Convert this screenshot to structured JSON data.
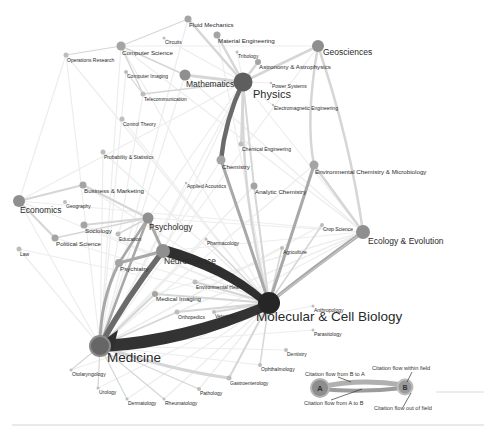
{
  "colors": {
    "background": "#ffffff",
    "faint_edge": "#ececec",
    "light_edge": "#d8d8d8",
    "mid_edge": "#b4b4b4",
    "dark_edge": "#7a7a7a",
    "strongest_edge": "#2e2e2e",
    "node_small": "#b9b9b9",
    "node_mid": "#8f8f8f",
    "node_large": "#5f5f5f",
    "node_hub": "#262626"
  },
  "nodes": [
    {
      "id": "fluid-mechanics",
      "label": "Fluid Mechanics",
      "x": 188,
      "y": 19,
      "r": 3.5,
      "size": "s"
    },
    {
      "id": "material-engineering",
      "label": "Material Engineering",
      "x": 217,
      "y": 35,
      "r": 3.5,
      "size": "s"
    },
    {
      "id": "circuits",
      "label": "Circuits",
      "x": 164,
      "y": 38,
      "r": 1.5,
      "size": "xs"
    },
    {
      "id": "computer-science",
      "label": "Computer Science",
      "x": 121,
      "y": 46,
      "r": 4.5,
      "size": "s"
    },
    {
      "id": "operations-research",
      "label": "Operations Research",
      "x": 66,
      "y": 55,
      "r": 2.5,
      "size": "xs"
    },
    {
      "id": "tribology",
      "label": "Tribology",
      "x": 237,
      "y": 52,
      "r": 1.5,
      "size": "xs"
    },
    {
      "id": "astronomy",
      "label": "Astronomy & Astrophysics",
      "x": 258,
      "y": 62,
      "r": 3,
      "size": "s"
    },
    {
      "id": "geosciences",
      "label": "Geosciences",
      "x": 318,
      "y": 46,
      "r": 6,
      "size": "m"
    },
    {
      "id": "computer-imaging",
      "label": "Computer Imaging",
      "x": 126,
      "y": 72,
      "r": 2,
      "size": "xs"
    },
    {
      "id": "mathematics",
      "label": "Mathematics",
      "x": 185,
      "y": 75,
      "r": 5.5,
      "size": "m"
    },
    {
      "id": "physics",
      "label": "Physics",
      "x": 243,
      "y": 82,
      "r": 9.5,
      "size": "l"
    },
    {
      "id": "power-systems",
      "label": "Power Systems",
      "x": 271,
      "y": 83,
      "r": 1.2,
      "size": "xs"
    },
    {
      "id": "telecommunication",
      "label": "Telecommunication",
      "x": 143,
      "y": 94,
      "r": 2.5,
      "size": "xs"
    },
    {
      "id": "electromagnetic-engineering",
      "label": "Electromagnetic Engineering",
      "x": 273,
      "y": 105,
      "r": 1.2,
      "size": "xs"
    },
    {
      "id": "control-theory",
      "label": "Control Theory",
      "x": 122,
      "y": 119,
      "r": 2.5,
      "size": "xs"
    },
    {
      "id": "chemical-engineering",
      "label": "Chemical Engineering",
      "x": 241,
      "y": 144,
      "r": 2.5,
      "size": "xs"
    },
    {
      "id": "probability-statistics",
      "label": "Probability & Statistics",
      "x": 103,
      "y": 152,
      "r": 2.5,
      "size": "xs"
    },
    {
      "id": "chemistry",
      "label": "Chemistry",
      "x": 221,
      "y": 160,
      "r": 4.5,
      "size": "s"
    },
    {
      "id": "environmental-chemistry",
      "label": "Environmental Chemistry & Microbiology",
      "x": 314,
      "y": 165,
      "r": 4.5,
      "size": "s"
    },
    {
      "id": "applied-acoustics",
      "label": "Applied Acoustics",
      "x": 186,
      "y": 183,
      "r": 1.2,
      "size": "xs"
    },
    {
      "id": "analytic-chemistry",
      "label": "Analytic Chemistry",
      "x": 254,
      "y": 186,
      "r": 3.5,
      "size": "s"
    },
    {
      "id": "business-marketing",
      "label": "Business & Marketing",
      "x": 83,
      "y": 185,
      "r": 3.5,
      "size": "s"
    },
    {
      "id": "economics",
      "label": "Economics",
      "x": 19,
      "y": 201,
      "r": 6,
      "size": "m"
    },
    {
      "id": "geography",
      "label": "Geography",
      "x": 65,
      "y": 202,
      "r": 2,
      "size": "xs"
    },
    {
      "id": "crop-science",
      "label": "Crop Science",
      "x": 322,
      "y": 225,
      "r": 2,
      "size": "xs"
    },
    {
      "id": "ecology-evolution",
      "label": "Ecology & Evolution",
      "x": 363,
      "y": 232,
      "r": 7,
      "size": "m"
    },
    {
      "id": "sociology",
      "label": "Sociology",
      "x": 84,
      "y": 225,
      "r": 3.5,
      "size": "s"
    },
    {
      "id": "psychology",
      "label": "Psychology",
      "x": 148,
      "y": 218,
      "r": 5.5,
      "size": "m"
    },
    {
      "id": "education",
      "label": "Education",
      "x": 118,
      "y": 234,
      "r": 2.5,
      "size": "xs"
    },
    {
      "id": "political-science",
      "label": "Political Science",
      "x": 55,
      "y": 238,
      "r": 3.5,
      "size": "s"
    },
    {
      "id": "agriculture",
      "label": "Agriculture",
      "x": 282,
      "y": 248,
      "r": 2,
      "size": "xs"
    },
    {
      "id": "pharmacology",
      "label": "Pharmacology",
      "x": 206,
      "y": 239,
      "r": 1.5,
      "size": "xs"
    },
    {
      "id": "law",
      "label": "Law",
      "x": 19,
      "y": 249,
      "r": 2.5,
      "size": "xs"
    },
    {
      "id": "neuroscience",
      "label": "Neuroscience",
      "x": 163,
      "y": 251,
      "r": 7,
      "size": "m"
    },
    {
      "id": "psychiatry",
      "label": "Psychiatry",
      "x": 119,
      "y": 263,
      "r": 4,
      "size": "s"
    },
    {
      "id": "environmental-health",
      "label": "Environmental Health",
      "x": 195,
      "y": 282,
      "r": 2.5,
      "size": "xs"
    },
    {
      "id": "medical-imaging",
      "label": "Medical Imaging",
      "x": 155,
      "y": 294,
      "r": 3,
      "size": "s"
    },
    {
      "id": "anthropology",
      "label": "Anthropology",
      "x": 313,
      "y": 306,
      "r": 1.5,
      "size": "xs"
    },
    {
      "id": "molecular-cell-biology",
      "label": "Molecular & Cell Biology",
      "x": 269,
      "y": 303,
      "r": 11,
      "size": "xl"
    },
    {
      "id": "orthopedics",
      "label": "Orthopedics",
      "x": 177,
      "y": 312,
      "r": 2.5,
      "size": "xs"
    },
    {
      "id": "veterinary",
      "label": "Veterinary",
      "x": 214,
      "y": 312,
      "r": 2,
      "size": "xs"
    },
    {
      "id": "parasitology",
      "label": "Parasitology",
      "x": 313,
      "y": 330,
      "r": 1.5,
      "size": "xs"
    },
    {
      "id": "dentistry",
      "label": "Dentistry",
      "x": 286,
      "y": 350,
      "r": 2,
      "size": "xs"
    },
    {
      "id": "medicine",
      "label": "Medicine",
      "x": 100,
      "y": 346,
      "r": 10,
      "size": "xl"
    },
    {
      "id": "ophthalmology",
      "label": "Ophthalmology",
      "x": 260,
      "y": 365,
      "r": 2,
      "size": "xs"
    },
    {
      "id": "otolaryngology",
      "label": "Otolaryngology",
      "x": 71,
      "y": 370,
      "r": 1.5,
      "size": "xs"
    },
    {
      "id": "gastroenterology",
      "label": "Gastroenterology",
      "x": 229,
      "y": 378,
      "r": 2.5,
      "size": "xs"
    },
    {
      "id": "urology",
      "label": "Urology",
      "x": 98,
      "y": 388,
      "r": 1.5,
      "size": "xs"
    },
    {
      "id": "pathology",
      "label": "Pathology",
      "x": 199,
      "y": 389,
      "r": 2,
      "size": "xs"
    },
    {
      "id": "dermatology",
      "label": "Dermatology",
      "x": 127,
      "y": 399,
      "r": 1.5,
      "size": "xs"
    },
    {
      "id": "rheumatology",
      "label": "Rheumatology",
      "x": 164,
      "y": 399,
      "r": 1.5,
      "size": "xs"
    }
  ],
  "legend": {
    "node_a": "A",
    "node_b": "B",
    "flow_b_to_a": "Citation flow from B to A",
    "flow_a_to_b": "Citation flow from A to B",
    "flow_within": "Citation flow within field",
    "flow_out": "Citation flow out of field"
  }
}
